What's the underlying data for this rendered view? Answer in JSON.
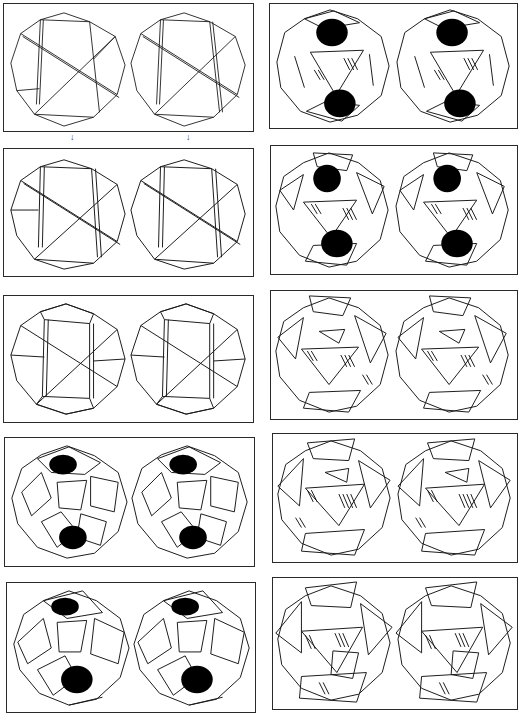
{
  "figure": {
    "columns": [
      {
        "panels": [
          {
            "id": "L1",
            "stage": 1,
            "box": [
              3,
              3,
              251,
              129
            ],
            "style": "wireframe"
          },
          {
            "id": "L2",
            "stage": 2,
            "box": [
              3,
              148,
              251,
              129
            ],
            "style": "wireframe-thick"
          },
          {
            "id": "L3",
            "stage": 3,
            "box": [
              3,
              295,
              251,
              128
            ],
            "style": "wireframe-twisted"
          },
          {
            "id": "L4",
            "stage": 4,
            "box": [
              4,
              437,
              251,
              130
            ],
            "style": "faces-small"
          },
          {
            "id": "L5",
            "stage": 5,
            "box": [
              6,
              582,
              250,
              131
            ],
            "style": "faces"
          }
        ]
      },
      {
        "panels": [
          {
            "id": "R1",
            "stage": 6,
            "box": [
              269,
              3,
              249,
              126
            ],
            "style": "faces-hatched"
          },
          {
            "id": "R2",
            "stage": 7,
            "box": [
              270,
              145,
              248,
              130
            ],
            "style": "faces-hatched"
          },
          {
            "id": "R3",
            "stage": 8,
            "box": [
              270,
              290,
              248,
              130
            ],
            "style": "faces-hatched"
          },
          {
            "id": "R4",
            "stage": 9,
            "box": [
              272,
              433,
              246,
              130
            ],
            "style": "faces-hatched-dense"
          },
          {
            "id": "R5",
            "stage": 10,
            "box": [
              272,
              577,
              246,
              133
            ],
            "style": "faces-hatched-dense"
          }
        ]
      }
    ],
    "arrows": [
      {
        "glyph": "↓",
        "x": 72,
        "y": 133
      },
      {
        "glyph": "↓",
        "x": 188,
        "y": 133
      }
    ],
    "colors": {
      "ink": "#1a1a1a",
      "paper": "#ffffff"
    }
  }
}
